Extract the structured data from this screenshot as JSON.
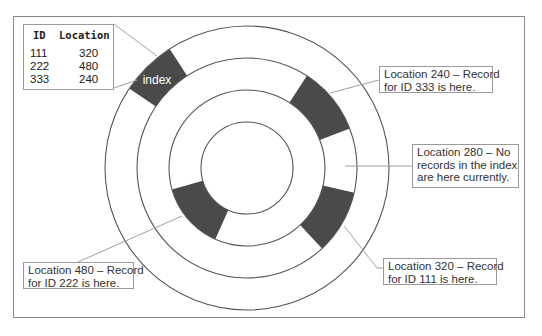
{
  "figure": {
    "index_table": {
      "headers": [
        "ID",
        "Location"
      ],
      "rows": [
        {
          "id": "111",
          "location": "320"
        },
        {
          "id": "222",
          "location": "480"
        },
        {
          "id": "333",
          "location": "240"
        }
      ]
    },
    "disc": {
      "index_sector_label": "index",
      "sector_color": "#4a4a4a",
      "ring_line_color": "#555555",
      "leader_line_color": "#a0a0a0"
    },
    "callouts": {
      "loc240": {
        "line1": "Location 240 – Record",
        "line2": "for ID 333 is here."
      },
      "loc280": {
        "line1": "Location 280 – No",
        "line2": "records in the index",
        "line3": "are here currently."
      },
      "loc320": {
        "line1": "Location 320 – Record",
        "line2": "for ID 111 is here."
      },
      "loc480": {
        "line1": "Location 480 – Record",
        "line2": "for ID 222 is here."
      }
    }
  }
}
